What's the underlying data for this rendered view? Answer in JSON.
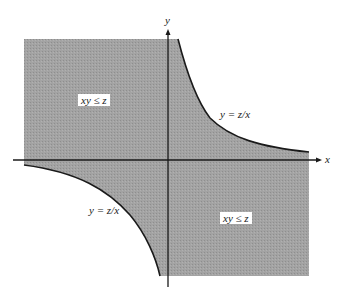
{
  "diagram": {
    "axes": {
      "x_label": "x",
      "y_label": "y"
    },
    "regions": [
      {
        "label": "xy ≤ z",
        "quadrant": "upper-left"
      },
      {
        "label": "xy ≤ z",
        "quadrant": "lower-right"
      }
    ],
    "curves": [
      {
        "label": "y = z/x",
        "branch": "first-quadrant"
      },
      {
        "label": "y = z/x",
        "branch": "third-quadrant"
      }
    ],
    "colors": {
      "shade": "#9c9c9c",
      "line": "#1a1a1a",
      "background": "#ffffff"
    }
  }
}
